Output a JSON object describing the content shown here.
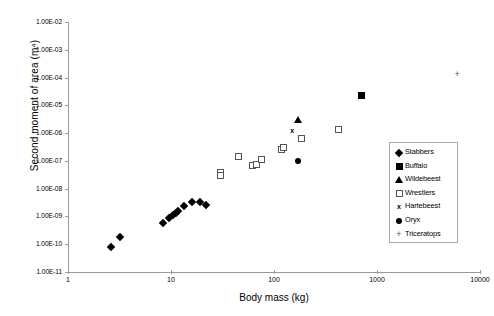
{
  "chart_data": {
    "type": "scatter",
    "title": "",
    "xlabel": "Body mass (kg)",
    "ylabel": "Second moment of area (m⁴)",
    "xscale": "log",
    "yscale": "log",
    "xlim": [
      1,
      10000
    ],
    "ylim": [
      1e-11,
      0.01
    ],
    "xticks": [
      "1",
      "10",
      "100",
      "1000",
      "10000"
    ],
    "xtick_values": [
      1,
      10,
      100,
      1000,
      10000
    ],
    "yticks": [
      "1.00E-02",
      "1.00E-03",
      "1.00E-04",
      "1.00E-05",
      "1.00E-06",
      "1.00E-07",
      "1.00E-08",
      "1.00E-09",
      "1.00E-10",
      "1.00E-11"
    ],
    "ytick_values": [
      0.01,
      0.001,
      0.0001,
      1e-05,
      1e-06,
      1e-07,
      1e-08,
      1e-09,
      1e-10,
      1e-11
    ],
    "grid": false,
    "legend_position": "right",
    "series": [
      {
        "name": "Stabbers",
        "marker": "filled-diamond",
        "color": "#000000",
        "points": [
          [
            2.6,
            8e-11
          ],
          [
            3.2,
            1.8e-10
          ],
          [
            10.5,
            1.1e-09
          ],
          [
            11.3,
            1.3e-09
          ],
          [
            11.8,
            1.6e-09
          ],
          [
            13.5,
            2.3e-09
          ],
          [
            16.0,
            3.3e-09
          ],
          [
            19.0,
            3.4e-09
          ],
          [
            22.0,
            2.6e-09
          ],
          [
            8.3,
            5.6e-10
          ],
          [
            9.6,
            8.6e-10
          ]
        ]
      },
      {
        "name": "Buffalo",
        "marker": "filled-square",
        "color": "#000000",
        "points": [
          [
            700,
            2.2e-05
          ]
        ]
      },
      {
        "name": "Wildebeest",
        "marker": "filled-triangle",
        "color": "#000000",
        "points": [
          [
            170,
            3.2e-06
          ]
        ]
      },
      {
        "name": "Wrestlers",
        "marker": "open-square",
        "color": "#555555",
        "points": [
          [
            30,
            3.8e-08
          ],
          [
            30,
            3e-08
          ],
          [
            45,
            1.4e-07
          ],
          [
            62,
            6.8e-08
          ],
          [
            67,
            7.4e-08
          ],
          [
            75,
            1.1e-07
          ],
          [
            118,
            2.6e-07
          ],
          [
            125,
            3e-07
          ],
          [
            185,
            6.5e-07
          ],
          [
            420,
            1.4e-06
          ]
        ]
      },
      {
        "name": "Hartebeest",
        "marker": "x",
        "color": "#000000",
        "points": [
          [
            150,
            1.2e-06
          ]
        ]
      },
      {
        "name": "Oryx",
        "marker": "filled-circle",
        "color": "#000000",
        "points": [
          [
            170,
            1e-07
          ]
        ]
      },
      {
        "name": "Triceratops",
        "marker": "plus",
        "color": "#555555",
        "points": [
          [
            6000,
            0.00013
          ]
        ]
      }
    ]
  },
  "legend": {
    "items": [
      {
        "label": "Stabbers",
        "marker": "filled-diamond"
      },
      {
        "label": "Buffalo",
        "marker": "filled-square"
      },
      {
        "label": "Wildebeest",
        "marker": "filled-triangle"
      },
      {
        "label": "Wrestlers",
        "marker": "open-square"
      },
      {
        "label": "Hartebeest",
        "marker": "x"
      },
      {
        "label": "Oryx",
        "marker": "filled-circle"
      },
      {
        "label": "Triceratops",
        "marker": "plus"
      }
    ]
  },
  "glyphs": {
    "x": "x",
    "plus": "+"
  }
}
